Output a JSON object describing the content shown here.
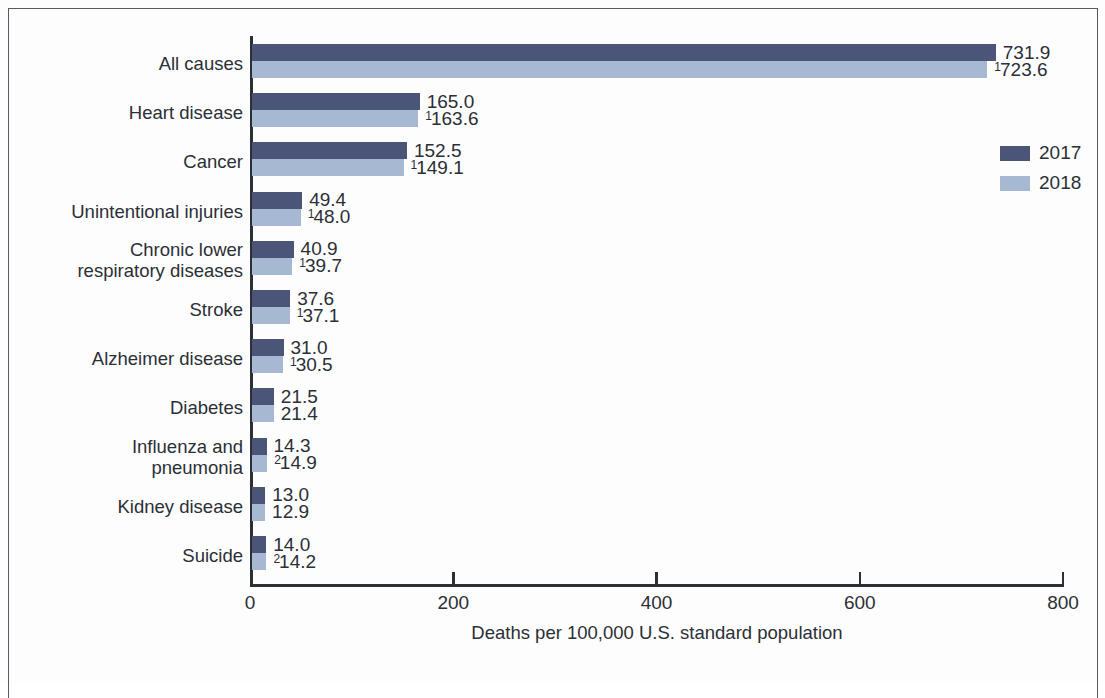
{
  "chart_data": {
    "type": "bar",
    "orientation": "horizontal",
    "title": "",
    "xlabel": "Deaths per 100,000 U.S. standard population",
    "ylabel": "",
    "xlim": [
      0,
      800
    ],
    "xticks": [
      0,
      200,
      400,
      600,
      800
    ],
    "xtick_labels": [
      "0",
      "200",
      "400",
      "600",
      "800"
    ],
    "grid": false,
    "legend_position": "right",
    "categories": [
      "All causes",
      "Heart disease",
      "Cancer",
      "Unintentional injuries",
      "Chronic lower\nrespiratory diseases",
      "Stroke",
      "Alzheimer disease",
      "Diabetes",
      "Influenza and\npneumonia",
      "Kidney disease",
      "Suicide"
    ],
    "series": [
      {
        "name": "2017",
        "color": "#4a5578",
        "values": [
          731.9,
          165.0,
          152.5,
          49.4,
          40.9,
          37.6,
          31.0,
          21.5,
          14.3,
          13.0,
          14.0
        ],
        "labels": [
          "731.9",
          "165.0",
          "152.5",
          "49.4",
          "40.9",
          "37.6",
          "31.0",
          "21.5",
          "14.3",
          "13.0",
          "14.0"
        ],
        "label_superscripts": [
          "",
          "",
          "",
          "",
          "",
          "",
          "",
          "",
          "",
          "",
          ""
        ]
      },
      {
        "name": "2018",
        "color": "#a7b8d2",
        "values": [
          723.6,
          163.6,
          149.1,
          48.0,
          39.7,
          37.1,
          30.5,
          21.4,
          14.9,
          12.9,
          14.2
        ],
        "labels": [
          "723.6",
          "163.6",
          "149.1",
          "48.0",
          "39.7",
          "37.1",
          "30.5",
          "21.4",
          "14.9",
          "12.9",
          "14.2"
        ],
        "label_superscripts": [
          "1",
          "1",
          "1",
          "1",
          "1",
          "1",
          "1",
          "",
          "2",
          "",
          "2"
        ]
      }
    ]
  },
  "legend": {
    "items": [
      {
        "label": "2017",
        "color": "#4a5578"
      },
      {
        "label": "2018",
        "color": "#a7b8d2"
      }
    ]
  }
}
